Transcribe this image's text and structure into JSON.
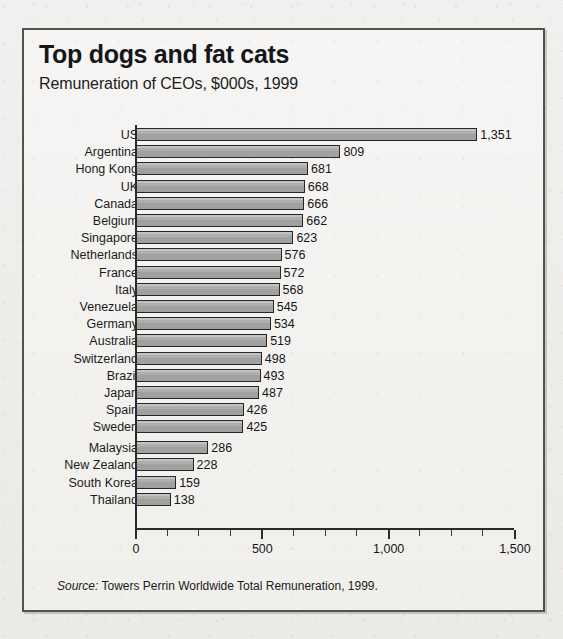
{
  "chart_data": {
    "type": "bar",
    "orientation": "horizontal",
    "title": "Top dogs and fat cats",
    "subtitle": "Remuneration of CEOs, $000s, 1999",
    "xlabel": "",
    "ylabel": "",
    "xlim": [
      0,
      1500
    ],
    "grid": false,
    "legend": null,
    "x_ticks": [
      {
        "value": 0,
        "label": "0"
      },
      {
        "value": 500,
        "label": "500"
      },
      {
        "value": 1000,
        "label": "1,000"
      },
      {
        "value": 1500,
        "label": "1,500"
      }
    ],
    "x_minor_tick_step": 125,
    "value_label_format": "comma-separated thousands",
    "categories": [
      "US",
      "Argentina",
      "Hong Kong",
      "UK",
      "Canada",
      "Belgium",
      "Singapore",
      "Netherlands",
      "France",
      "Italy",
      "Venezuela",
      "Germany",
      "Australia",
      "Switzerland",
      "Brazil",
      "Japan",
      "Spain",
      "Sweden",
      "Malaysia",
      "New Zealand",
      "South Korea",
      "Thailand"
    ],
    "values": [
      1351,
      809,
      681,
      668,
      666,
      662,
      623,
      576,
      572,
      568,
      545,
      534,
      519,
      498,
      493,
      487,
      426,
      425,
      286,
      228,
      159,
      138
    ],
    "value_labels": [
      "1,351",
      "809",
      "681",
      "668",
      "666",
      "662",
      "623",
      "576",
      "572",
      "568",
      "545",
      "534",
      "519",
      "498",
      "493",
      "487",
      "426",
      "425",
      "286",
      "228",
      "159",
      "138"
    ],
    "colors": {
      "bar_fill": "#a9a9a7",
      "bar_stroke": "#26272a",
      "axis": "#2a2b2e",
      "text": "#15161a",
      "panel_background": "#f4f3f1",
      "frame_border": "#52524f"
    }
  },
  "source": {
    "lead": "Source:",
    "text": " Towers Perrin Worldwide Total Remuneration, 1999."
  }
}
